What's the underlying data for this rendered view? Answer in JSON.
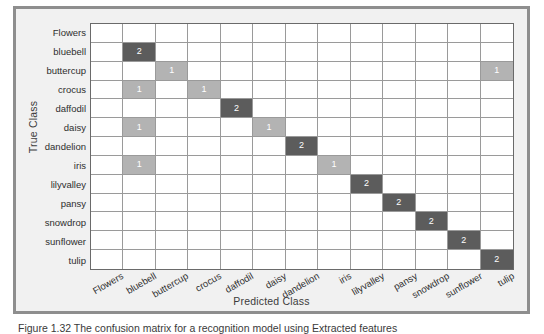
{
  "figure": {
    "ylabel": "True Class",
    "xlabel": "Predicted Class",
    "caption": "Figure 1.32   The confusion matrix for a recognition model using Extracted features"
  },
  "chart_data": {
    "type": "heatmap",
    "title": "",
    "xlabel": "Predicted Class",
    "ylabel": "True Class",
    "categories": [
      "Flowers",
      "bluebell",
      "buttercup",
      "crocus",
      "daffodil",
      "daisy",
      "dandelion",
      "iris",
      "lilyvalley",
      "pansy",
      "snowdrop",
      "sunflower",
      "tulip"
    ],
    "row_labels": [
      "Flowers",
      "bluebell",
      "buttercup",
      "crocus",
      "daffodil",
      "daisy",
      "dandelion",
      "iris",
      "lilyvalley",
      "pansy",
      "snowdrop",
      "sunflower",
      "tulip"
    ],
    "column_labels": [
      "Flowers",
      "bluebell",
      "buttercup",
      "crocus",
      "daffodil",
      "daisy",
      "dandelion",
      "iris",
      "lilyvalley",
      "pansy",
      "snowdrop",
      "sunflower",
      "tulip"
    ],
    "colors": {
      "empty": "#ffffff",
      "value_1": "#b3b3b3",
      "value_2": "#5c5c5c",
      "grid_line": "#9a9a9a",
      "frame": "#8e8e8e",
      "background": "#f1f1f1"
    },
    "legend": "",
    "grid": true,
    "values": [
      [
        0,
        0,
        0,
        0,
        0,
        0,
        0,
        0,
        0,
        0,
        0,
        0,
        0
      ],
      [
        0,
        2,
        0,
        0,
        0,
        0,
        0,
        0,
        0,
        0,
        0,
        0,
        0
      ],
      [
        0,
        0,
        1,
        0,
        0,
        0,
        0,
        0,
        0,
        0,
        0,
        0,
        1
      ],
      [
        0,
        1,
        0,
        1,
        0,
        0,
        0,
        0,
        0,
        0,
        0,
        0,
        0
      ],
      [
        0,
        0,
        0,
        0,
        2,
        0,
        0,
        0,
        0,
        0,
        0,
        0,
        0
      ],
      [
        0,
        1,
        0,
        0,
        0,
        1,
        0,
        0,
        0,
        0,
        0,
        0,
        0
      ],
      [
        0,
        0,
        0,
        0,
        0,
        0,
        2,
        0,
        0,
        0,
        0,
        0,
        0
      ],
      [
        0,
        1,
        0,
        0,
        0,
        0,
        0,
        1,
        0,
        0,
        0,
        0,
        0
      ],
      [
        0,
        0,
        0,
        0,
        0,
        0,
        0,
        0,
        2,
        0,
        0,
        0,
        0
      ],
      [
        0,
        0,
        0,
        0,
        0,
        0,
        0,
        0,
        0,
        2,
        0,
        0,
        0
      ],
      [
        0,
        0,
        0,
        0,
        0,
        0,
        0,
        0,
        0,
        0,
        2,
        0,
        0
      ],
      [
        0,
        0,
        0,
        0,
        0,
        0,
        0,
        0,
        0,
        0,
        0,
        2,
        0
      ],
      [
        0,
        0,
        0,
        0,
        0,
        0,
        0,
        0,
        0,
        0,
        0,
        0,
        2
      ]
    ]
  }
}
